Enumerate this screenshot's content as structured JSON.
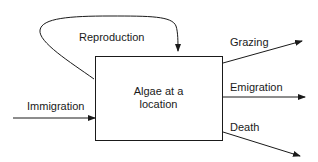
{
  "diagram": {
    "central_box": {
      "line1": "Algae at a",
      "line2": "location"
    },
    "flows": {
      "reproduction": "Reproduction",
      "immigration": "Immigration",
      "grazing": "Grazing",
      "emigration": "Emigration",
      "death": "Death"
    },
    "colors": {
      "stroke": "#1a1a1a",
      "background": "#ffffff"
    }
  }
}
